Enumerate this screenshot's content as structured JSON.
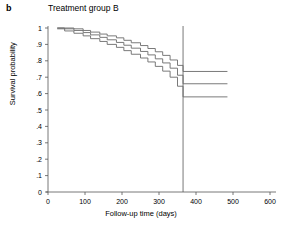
{
  "panel": {
    "label": "b"
  },
  "chart_data": {
    "type": "line",
    "title": "Treatment group B",
    "xlabel": "Follow-up time (days)",
    "ylabel": "Survival probability",
    "xlim": [
      0,
      600
    ],
    "ylim": [
      0,
      1
    ],
    "xticks": [
      0,
      100,
      200,
      300,
      400,
      500,
      600
    ],
    "xtick_labels": [
      "0",
      "100",
      "200",
      "300",
      "400",
      "500",
      "600"
    ],
    "yticks": [
      0,
      0.1,
      0.2,
      0.3,
      0.4,
      0.5,
      0.6,
      0.7,
      0.8,
      0.9,
      1
    ],
    "ytick_labels": [
      "0",
      ".1",
      ".2",
      ".3",
      ".4",
      ".5",
      ".6",
      ".7",
      ".8",
      ".9",
      "1"
    ],
    "grid": false,
    "legend": "none",
    "line_color": "#6b6b6b",
    "annotations": [
      {
        "name": "reference-line",
        "type": "vline",
        "x": 365,
        "label": ""
      }
    ],
    "series": [
      {
        "name": "Upper 95% confidence limit",
        "step": true,
        "x": [
          25,
          45,
          70,
          95,
          115,
          140,
          160,
          185,
          205,
          225,
          250,
          270,
          290,
          310,
          330,
          350,
          365,
          485
        ],
        "values": [
          1.0,
          1.0,
          0.995,
          0.985,
          0.975,
          0.963,
          0.952,
          0.94,
          0.925,
          0.91,
          0.893,
          0.875,
          0.855,
          0.833,
          0.805,
          0.772,
          0.735,
          0.735
        ]
      },
      {
        "name": "Survival estimate",
        "step": true,
        "x": [
          25,
          45,
          70,
          95,
          115,
          140,
          160,
          185,
          205,
          225,
          250,
          270,
          290,
          310,
          330,
          350,
          365,
          485
        ],
        "values": [
          1.0,
          0.995,
          0.985,
          0.972,
          0.958,
          0.943,
          0.928,
          0.912,
          0.895,
          0.877,
          0.857,
          0.836,
          0.812,
          0.787,
          0.755,
          0.712,
          0.66,
          0.66
        ]
      },
      {
        "name": "Lower 95% confidence limit",
        "step": true,
        "x": [
          25,
          45,
          70,
          95,
          115,
          140,
          160,
          185,
          205,
          225,
          250,
          270,
          290,
          310,
          330,
          350,
          365,
          485
        ],
        "values": [
          0.995,
          0.982,
          0.968,
          0.952,
          0.935,
          0.918,
          0.9,
          0.882,
          0.862,
          0.84,
          0.817,
          0.793,
          0.766,
          0.737,
          0.7,
          0.645,
          0.58,
          0.58
        ]
      }
    ]
  }
}
